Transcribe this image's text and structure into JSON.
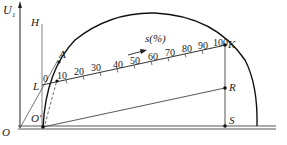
{
  "labels": {
    "u1": "U",
    "u1_sub": "1",
    "H": "H",
    "A": "A",
    "L": "L",
    "O": "O",
    "O_prime": "O'",
    "K": "K",
    "R": "R",
    "S": "S",
    "scale_title": "s(%)"
  },
  "scale": {
    "ticks": [
      "0",
      "10",
      "20",
      "30",
      "40",
      "50",
      "60",
      "70",
      "80",
      "90",
      "100"
    ]
  },
  "colors": {
    "line": "#222222",
    "thin_line": "#555555",
    "background": "#ffffff"
  }
}
